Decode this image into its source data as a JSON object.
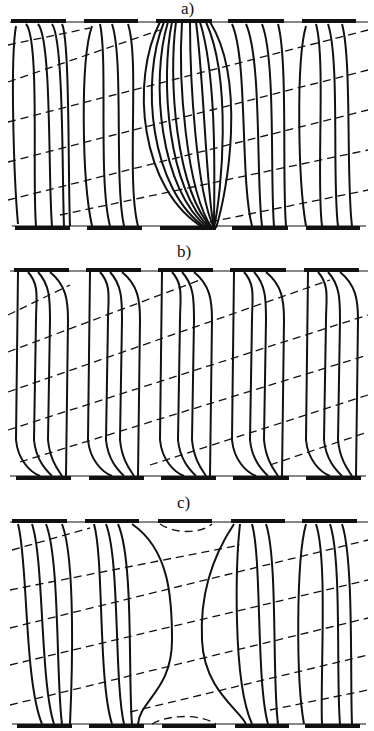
{
  "figure": {
    "panels": [
      {
        "id": "a",
        "label": "a)",
        "label_x": 181,
        "label_y": 0
      },
      {
        "id": "b",
        "label": "b)",
        "label_x": 177,
        "label_y": 243
      },
      {
        "id": "c",
        "label": "c)",
        "label_x": 177,
        "label_y": 494
      }
    ],
    "colors": {
      "ink": "#111111",
      "background": "#ffffff"
    }
  }
}
